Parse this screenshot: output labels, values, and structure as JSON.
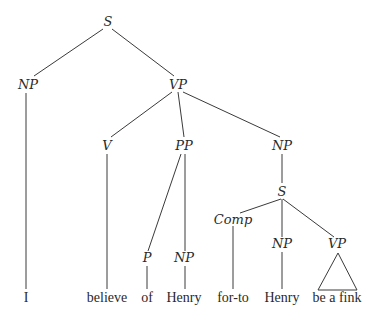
{
  "diagram": {
    "type": "syntax-tree",
    "nodes": [
      {
        "id": "s_root",
        "label": "S",
        "x": 108,
        "y": 26,
        "kind": "category"
      },
      {
        "id": "np_subj",
        "label": "NP",
        "x": 28,
        "y": 89,
        "kind": "category"
      },
      {
        "id": "vp_main",
        "label": "VP",
        "x": 178,
        "y": 89,
        "kind": "category"
      },
      {
        "id": "v",
        "label": "V",
        "x": 107,
        "y": 150,
        "kind": "category"
      },
      {
        "id": "pp",
        "label": "PP",
        "x": 184,
        "y": 150,
        "kind": "category"
      },
      {
        "id": "np_obj",
        "label": "NP",
        "x": 282,
        "y": 150,
        "kind": "category"
      },
      {
        "id": "s_emb",
        "label": "S",
        "x": 282,
        "y": 196,
        "kind": "category"
      },
      {
        "id": "comp",
        "label": "Comp",
        "x": 233,
        "y": 224,
        "kind": "category"
      },
      {
        "id": "p",
        "label": "P",
        "x": 147,
        "y": 262,
        "kind": "category"
      },
      {
        "id": "np_pp",
        "label": "NP",
        "x": 184,
        "y": 262,
        "kind": "category"
      },
      {
        "id": "np_emb",
        "label": "NP",
        "x": 282,
        "y": 248,
        "kind": "category"
      },
      {
        "id": "vp_emb",
        "label": "VP",
        "x": 337,
        "y": 248,
        "kind": "category"
      },
      {
        "id": "w_i",
        "label": "I",
        "x": 26,
        "y": 302,
        "kind": "leaf"
      },
      {
        "id": "w_believe",
        "label": "believe",
        "x": 107,
        "y": 302,
        "kind": "leaf"
      },
      {
        "id": "w_of",
        "label": "of",
        "x": 147,
        "y": 302,
        "kind": "leaf"
      },
      {
        "id": "w_henry1",
        "label": "Henry",
        "x": 184,
        "y": 302,
        "kind": "leaf"
      },
      {
        "id": "w_forto",
        "label": "for-to",
        "x": 233,
        "y": 302,
        "kind": "leaf"
      },
      {
        "id": "w_henry2",
        "label": "Henry",
        "x": 282,
        "y": 302,
        "kind": "leaf"
      },
      {
        "id": "w_beafink",
        "label": "be a fink",
        "x": 337,
        "y": 302,
        "kind": "leaf"
      }
    ],
    "edges": [
      {
        "from": "s_root",
        "to": "np_subj",
        "x1": 103,
        "y1": 29,
        "x2": 34,
        "y2": 76
      },
      {
        "from": "s_root",
        "to": "vp_main",
        "x1": 112,
        "y1": 29,
        "x2": 174,
        "y2": 76
      },
      {
        "from": "np_subj",
        "to": "w_i",
        "x1": 26,
        "y1": 93,
        "x2": 26,
        "y2": 289
      },
      {
        "from": "vp_main",
        "to": "v",
        "x1": 172,
        "y1": 92,
        "x2": 111,
        "y2": 137
      },
      {
        "from": "vp_main",
        "to": "pp",
        "x1": 178,
        "y1": 92,
        "x2": 184,
        "y2": 137
      },
      {
        "from": "vp_main",
        "to": "np_obj",
        "x1": 183,
        "y1": 92,
        "x2": 280,
        "y2": 137
      },
      {
        "from": "v",
        "to": "w_believe",
        "x1": 107,
        "y1": 154,
        "x2": 107,
        "y2": 289
      },
      {
        "from": "pp",
        "to": "p",
        "x1": 181,
        "y1": 154,
        "x2": 148,
        "y2": 251
      },
      {
        "from": "pp",
        "to": "np_pp",
        "x1": 185,
        "y1": 154,
        "x2": 185,
        "y2": 251
      },
      {
        "from": "np_obj",
        "to": "s_emb",
        "x1": 282,
        "y1": 154,
        "x2": 282,
        "y2": 183
      },
      {
        "from": "s_emb",
        "to": "comp",
        "x1": 281,
        "y1": 199,
        "x2": 240,
        "y2": 213
      },
      {
        "from": "s_emb",
        "to": "np_emb",
        "x1": 282,
        "y1": 199,
        "x2": 282,
        "y2": 237
      },
      {
        "from": "s_emb",
        "to": "vp_emb",
        "x1": 283,
        "y1": 199,
        "x2": 334,
        "y2": 237
      },
      {
        "from": "comp",
        "to": "w_forto",
        "x1": 233,
        "y1": 226,
        "x2": 233,
        "y2": 289
      },
      {
        "from": "p",
        "to": "w_of",
        "x1": 147,
        "y1": 266,
        "x2": 147,
        "y2": 289
      },
      {
        "from": "np_pp",
        "to": "w_henry1",
        "x1": 185,
        "y1": 266,
        "x2": 185,
        "y2": 289
      },
      {
        "from": "np_emb",
        "to": "w_henry2",
        "x1": 282,
        "y1": 252,
        "x2": 282,
        "y2": 289
      }
    ],
    "triangle": {
      "parent": "vp_emb",
      "covers": "w_beafink",
      "apex_x": 338,
      "apex_y": 253,
      "left_x": 318,
      "right_x": 357,
      "base_y": 290
    }
  }
}
